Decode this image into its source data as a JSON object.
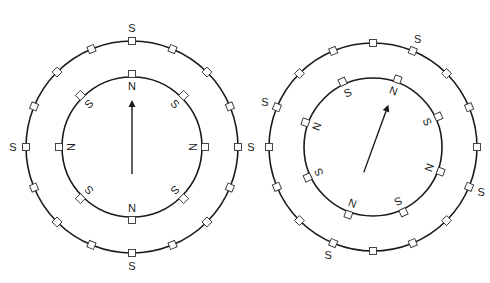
{
  "diagram": {
    "colors": {
      "line": "#1a1a1a",
      "background": "#ffffff"
    },
    "panels": [
      {
        "id": "left",
        "center": [
          132,
          147
        ],
        "outer_radius": 106,
        "inner_radius": 70,
        "outer_slots": 16,
        "inner_slots": 8,
        "outer_labels": [
          {
            "text": "S",
            "angle": 0
          },
          {
            "text": "S",
            "angle": 90
          },
          {
            "text": "S",
            "angle": 180
          },
          {
            "text": "S",
            "angle": 270
          }
        ],
        "inner_rotation": 0,
        "inner_labels": [
          {
            "text": "N",
            "angle": 0
          },
          {
            "text": "S",
            "angle": 45
          },
          {
            "text": "N",
            "angle": 90
          },
          {
            "text": "S",
            "angle": 135
          },
          {
            "text": "N",
            "angle": 180
          },
          {
            "text": "S",
            "angle": 225
          },
          {
            "text": "N",
            "angle": 270
          },
          {
            "text": "S",
            "angle": 315
          }
        ],
        "arrow_angle": 0,
        "arrow_length": 62
      },
      {
        "id": "right",
        "center": [
          373,
          147
        ],
        "outer_radius": 104,
        "inner_radius": 69,
        "outer_slots": 16,
        "inner_slots": 8,
        "outer_labels": [
          {
            "text": "S",
            "angle": 22.5
          },
          {
            "text": "S",
            "angle": 112.5
          },
          {
            "text": "S",
            "angle": 202.5
          },
          {
            "text": "S",
            "angle": 292.5
          }
        ],
        "inner_rotation": 20,
        "inner_labels": [
          {
            "text": "N",
            "angle": 0
          },
          {
            "text": "S",
            "angle": 45
          },
          {
            "text": "N",
            "angle": 90
          },
          {
            "text": "S",
            "angle": 135
          },
          {
            "text": "N",
            "angle": 180
          },
          {
            "text": "S",
            "angle": 225
          },
          {
            "text": "N",
            "angle": 270
          },
          {
            "text": "S",
            "angle": 315
          }
        ],
        "arrow_angle": 20,
        "arrow_length": 60
      }
    ]
  }
}
